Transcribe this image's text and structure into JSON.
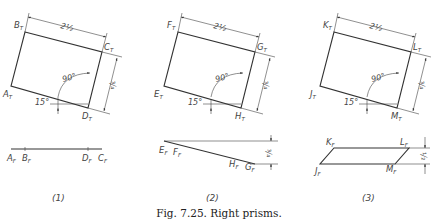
{
  "figure": {
    "caption": "Fig. 7.25. Right prisms.",
    "colors": {
      "ink": "#333333",
      "background": "#ffffff"
    }
  },
  "views": [
    {
      "number": "(1)",
      "top_view": {
        "vertices": [
          {
            "name": "A",
            "sub": "T"
          },
          {
            "name": "B",
            "sub": "T"
          },
          {
            "name": "C",
            "sub": "T"
          },
          {
            "name": "D",
            "sub": "T"
          }
        ],
        "width_dim": "2½",
        "depth_dim": "¾",
        "angle_right": "90°",
        "angle_tilt": "15°"
      },
      "front_view": {
        "labels": [
          {
            "name": "A",
            "sub": "F"
          },
          {
            "name": "B",
            "sub": "F"
          },
          {
            "name": "D",
            "sub": "F"
          },
          {
            "name": "C",
            "sub": "F"
          }
        ]
      }
    },
    {
      "number": "(2)",
      "top_view": {
        "vertices": [
          {
            "name": "E",
            "sub": "T"
          },
          {
            "name": "F",
            "sub": "T"
          },
          {
            "name": "G",
            "sub": "T"
          },
          {
            "name": "H",
            "sub": "T"
          }
        ],
        "width_dim": "2½",
        "depth_dim": "¾",
        "angle_right": "90°",
        "angle_tilt": "15°"
      },
      "front_view": {
        "labels": [
          {
            "name": "E",
            "sub": "F"
          },
          {
            "name": "F",
            "sub": "F"
          },
          {
            "name": "H",
            "sub": "F"
          },
          {
            "name": "G",
            "sub": "F"
          }
        ],
        "height_dim": "¾"
      }
    },
    {
      "number": "(3)",
      "top_view": {
        "vertices": [
          {
            "name": "J",
            "sub": "T"
          },
          {
            "name": "K",
            "sub": "T"
          },
          {
            "name": "L",
            "sub": "T"
          },
          {
            "name": "M",
            "sub": "T"
          }
        ],
        "width_dim": "2½",
        "depth_dim": "¾",
        "angle_right": "90°",
        "angle_tilt": "15°"
      },
      "front_view": {
        "labels": [
          {
            "name": "K",
            "sub": "F"
          },
          {
            "name": "L",
            "sub": "F"
          },
          {
            "name": "J",
            "sub": "F"
          },
          {
            "name": "M",
            "sub": "F"
          }
        ],
        "height_dim": "½"
      }
    }
  ]
}
